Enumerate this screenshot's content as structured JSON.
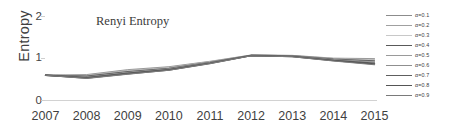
{
  "chart_data": {
    "type": "line",
    "title": "Renyi Entropy",
    "xlabel": "",
    "ylabel": "Entropy",
    "categories": [
      "2007",
      "2008",
      "2009",
      "2010",
      "2011",
      "2012",
      "2013",
      "2014",
      "2015"
    ],
    "x": [
      2007,
      2008,
      2009,
      2010,
      2011,
      2012,
      2013,
      2014,
      2015
    ],
    "ylim": [
      0,
      2
    ],
    "yticks": [
      "0",
      "1",
      "2"
    ],
    "ytick_values": [
      0,
      1,
      2
    ],
    "grid": false,
    "legend_position": "right",
    "series": [
      {
        "name": "α=0.1",
        "color": "#8c8c8c",
        "width": 0.9,
        "values": [
          0.55,
          0.565,
          0.675,
          0.74,
          0.86,
          1.0,
          0.992,
          0.93,
          0.92
        ]
      },
      {
        "name": "α=0.2",
        "color": "#a0a0a0",
        "width": 0.9,
        "values": [
          0.55,
          0.552,
          0.66,
          0.728,
          0.852,
          0.998,
          0.988,
          0.922,
          0.902
        ]
      },
      {
        "name": "α=0.3",
        "color": "#c8c8c8",
        "width": 0.8,
        "values": [
          0.55,
          0.54,
          0.645,
          0.716,
          0.845,
          0.996,
          0.984,
          0.914,
          0.886
        ]
      },
      {
        "name": "α=0.4",
        "color": "#595959",
        "width": 1.3,
        "values": [
          0.55,
          0.528,
          0.63,
          0.704,
          0.838,
          0.994,
          0.98,
          0.906,
          0.868
        ]
      },
      {
        "name": "α=0.5",
        "color": "#9a9a9a",
        "width": 0.9,
        "values": [
          0.55,
          0.516,
          0.616,
          0.694,
          0.831,
          0.992,
          0.976,
          0.898,
          0.852
        ]
      },
      {
        "name": "α=0.6",
        "color": "#8f8f8f",
        "width": 0.9,
        "values": [
          0.55,
          0.506,
          0.604,
          0.684,
          0.825,
          0.99,
          0.972,
          0.89,
          0.836
        ]
      },
      {
        "name": "α=0.7",
        "color": "#5e5e5e",
        "width": 1.3,
        "values": [
          0.55,
          0.496,
          0.594,
          0.676,
          0.819,
          0.988,
          0.968,
          0.882,
          0.818
        ]
      },
      {
        "name": "α=0.8",
        "color": "#555555",
        "width": 1.4,
        "values": [
          0.55,
          0.488,
          0.584,
          0.668,
          0.813,
          0.986,
          0.964,
          0.874,
          0.8
        ]
      },
      {
        "name": "α=0.9",
        "color": "#7a7a7a",
        "width": 1.1,
        "values": [
          0.55,
          0.48,
          0.576,
          0.66,
          0.808,
          0.984,
          0.96,
          0.866,
          0.784
        ]
      }
    ]
  },
  "axis": {
    "y_label": "Entropy",
    "y_tick_2": "2",
    "y_tick_1": "1",
    "y_tick_0": "0"
  },
  "title": "Renyi Entropy"
}
